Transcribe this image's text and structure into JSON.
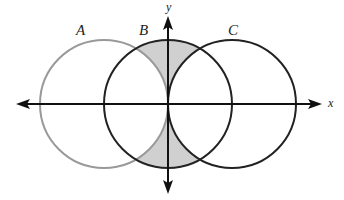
{
  "diagram": {
    "type": "venn-on-axes",
    "axes": {
      "x_label": "x",
      "y_label": "y",
      "origin": [
        168,
        104
      ]
    },
    "circles": [
      {
        "label": "A",
        "cx": 104,
        "cy": 104,
        "r": 64,
        "stroke": "#999999"
      },
      {
        "label": "B",
        "cx": 168,
        "cy": 104,
        "r": 64,
        "stroke": "#222222"
      },
      {
        "label": "C",
        "cx": 232,
        "cy": 104,
        "r": 64,
        "stroke": "#222222"
      }
    ],
    "shaded_region": {
      "description": "B minus (A union C)",
      "fill": "#d0d0d0"
    }
  }
}
